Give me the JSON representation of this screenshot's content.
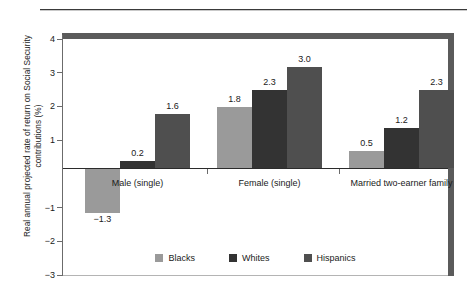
{
  "chart_data": {
    "type": "bar",
    "title": "",
    "xlabel": "",
    "ylabel": "Real annual projected rate of return on Social Security contributions (%)",
    "categories": [
      "Male (single)",
      "Female (single)",
      "Married two-earner family"
    ],
    "series": [
      {
        "name": "Blacks",
        "color": "#9a9a9a",
        "values": [
          -1.3,
          1.8,
          0.5
        ]
      },
      {
        "name": "Whites",
        "color": "#333333",
        "values": [
          0.2,
          2.3,
          1.2
        ]
      },
      {
        "name": "Hispanics",
        "color": "#4f4f4f",
        "values": [
          1.6,
          3.0,
          2.3
        ]
      }
    ],
    "value_labels": {
      "Male (single)": [
        "−1.3",
        "0.2",
        "1.6"
      ],
      "Female (single)": [
        "1.8",
        "2.3",
        "3.0"
      ],
      "Married two-earner family": [
        "0.5",
        "1.2",
        "2.3"
      ]
    },
    "ylim": [
      -3,
      4
    ],
    "yticks": [
      4,
      3,
      2,
      1,
      -1,
      -2,
      -3
    ],
    "ytick_labels": [
      "4",
      "3",
      "2",
      "1",
      "−1",
      "−2",
      "−3"
    ],
    "grid": false,
    "legend_position": "bottom-center"
  },
  "axis": {
    "y_label": "Real annual projected rate of return on Social Security contributions (%)"
  }
}
